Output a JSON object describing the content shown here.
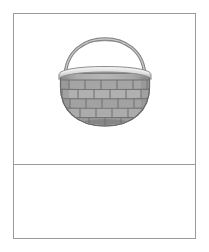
{
  "document": {
    "title": "",
    "background_color": "#ffffff"
  },
  "frame": {
    "border_color": "#9b9b9b",
    "fill_color": "#ffffff",
    "divider_color": "#9b9b9b"
  },
  "panels": [
    {
      "id": "image-panel",
      "name": "top-panel",
      "content_type": "illustration",
      "caption": ""
    },
    {
      "id": "caption-panel",
      "name": "bottom-panel",
      "content_type": "empty",
      "caption": ""
    }
  ],
  "illustration": {
    "name": "wicker-basket",
    "alt_text": "Gray woven wicker basket with arched handle",
    "palette": {
      "handle_stroke": "#8d8d8d",
      "handle_highlight": "#c9c9c9",
      "rim_light": "#e2e2e2",
      "rim_shadow": "#a8a8a8",
      "weave_light": "#b4b4b4",
      "weave_mid": "#9d9d9d",
      "weave_dark": "#7d7d7d",
      "body_base": "#a6a6a6",
      "base_shadow": "#6f6f6f",
      "outline": "#6b6b6b"
    },
    "weave_rows": 5,
    "handle": {
      "shape": "arch",
      "top_y": 8,
      "span": 82
    }
  }
}
